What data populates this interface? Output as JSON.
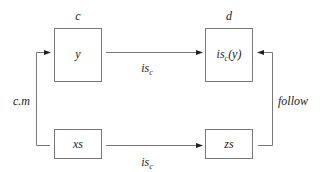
{
  "diagram": {
    "nodes": [
      {
        "id": "y",
        "label": "y",
        "header": "c"
      },
      {
        "id": "isc_y",
        "label_main": "is",
        "label_sub": "c",
        "label_tail": "(y)",
        "header": "d"
      },
      {
        "id": "xs",
        "label": "xs"
      },
      {
        "id": "zs",
        "label": "zs"
      }
    ],
    "edges": [
      {
        "from": "y",
        "to": "isc_y",
        "label_main": "is",
        "label_sub": "c"
      },
      {
        "from": "xs",
        "to": "zs",
        "label_main": "is",
        "label_sub": "c"
      },
      {
        "from": "xs",
        "to": "y",
        "label": "c.m"
      },
      {
        "from": "zs",
        "to": "isc_y",
        "label": "follow"
      }
    ]
  }
}
